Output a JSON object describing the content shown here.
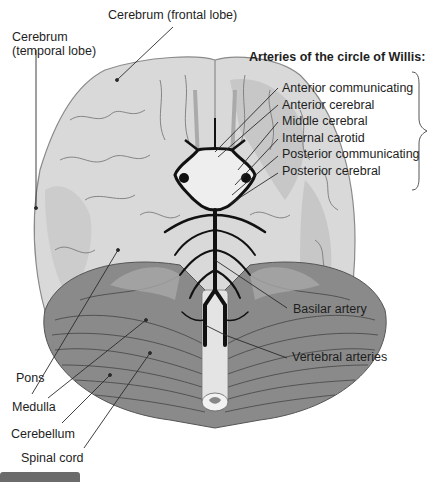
{
  "diagram": {
    "title": "Arteries of the circle of Willis:",
    "labels": {
      "frontal_lobe": "Cerebrum (frontal lobe)",
      "temporal_lobe_line1": "Cerebrum",
      "temporal_lobe_line2": "(temporal lobe)",
      "basilar": "Basilar artery",
      "vertebral": "Vertebral arteries",
      "pons": "Pons",
      "medulla": "Medulla",
      "cerebellum": "Cerebellum",
      "spinal_cord": "Spinal cord"
    },
    "willis_arteries": [
      "Anterior communicating",
      "Anterior cerebral",
      "Middle cerebral",
      "Internal carotid",
      "Posterior communicating",
      "Posterior cerebral"
    ]
  },
  "colors": {
    "cerebrum": "#d9d9d9",
    "cerebrum_shade": "#bdbdbd",
    "cerebellum": "#8a8a8a",
    "arteries": "#111111",
    "leader_lines": "#2a2a2a",
    "tab": "#6b6b6b"
  }
}
